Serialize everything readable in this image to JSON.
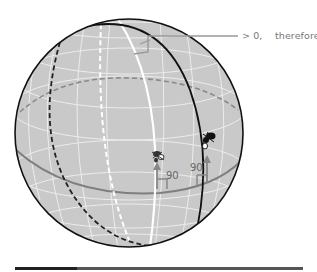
{
  "diagram": {
    "annotation": {
      "excess_text": "> 0,",
      "conclusion_text": "therefore: Σ > 180"
    },
    "angles": [
      {
        "label": "90",
        "position": "left vertex on equator"
      },
      {
        "label": "90",
        "position": "right vertex on equator"
      }
    ],
    "colors": {
      "sphere_fill": "#c8c8c8",
      "grid_lines": "#ececec",
      "outline": "#111111",
      "equator": "#808080",
      "great_circle_white": "#ffffff",
      "annotation_text": "#777777"
    },
    "figures": [
      {
        "name": "ant-figure-left",
        "description": "small insect walking on sphere"
      },
      {
        "name": "ant-figure-right",
        "description": "small insect walking on sphere"
      }
    ]
  }
}
